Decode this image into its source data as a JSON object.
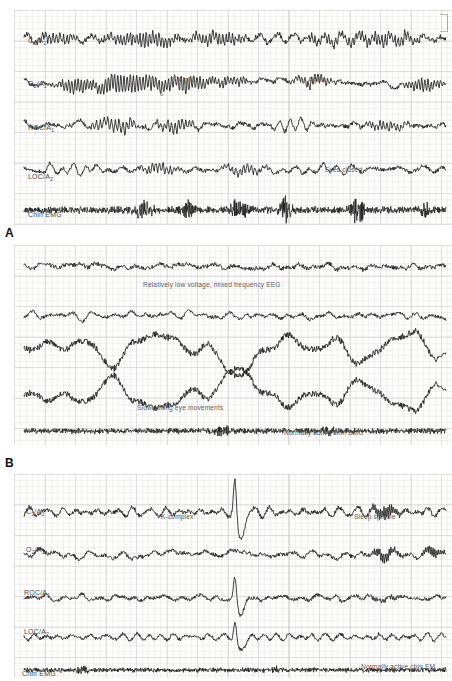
{
  "figure": {
    "background": "#ffffff",
    "trace_color": "#1b1b1b",
    "grid_color": "#96879 6",
    "label_color": "#4a4a4a"
  },
  "panels": [
    {
      "id": "A",
      "letter": "A",
      "stage": "Stage wake / drowsy",
      "channels": [
        {
          "label": "C",
          "sub1": "3",
          "label2": "/A",
          "sub2": "2",
          "full": "C3/A2",
          "type": "eeg"
        },
        {
          "label": "O",
          "sub1": "2",
          "label2": "/A",
          "sub2": "1",
          "full": "O2/A1",
          "type": "eeg"
        },
        {
          "label": "ROC/A",
          "sub1": "",
          "label2": "",
          "sub2": "1",
          "full": "ROC/A1",
          "type": "eog"
        },
        {
          "label": "LOC/A",
          "sub1": "",
          "label2": "",
          "sub2": "2",
          "full": "LOC/A2",
          "type": "eog"
        },
        {
          "label": "Chin EMG",
          "sub1": "",
          "label2": "",
          "sub2": "",
          "full": "Chin EMG",
          "type": "emg"
        }
      ],
      "annotations": [
        {
          "text": "Alpha",
          "x": 155,
          "y": 81
        },
        {
          "text": "o",
          "x": 160,
          "y": 95
        },
        {
          "text": "Alpha",
          "x": 310,
          "y": 81
        },
        {
          "text": "Eyes closed",
          "x": 330,
          "y": 170
        }
      ]
    },
    {
      "id": "B",
      "letter": "B",
      "stage": "Stage 1 sleep",
      "channels": [
        {
          "full": "C3/A2",
          "type": "eeg"
        },
        {
          "full": "O2/A1",
          "type": "eeg"
        },
        {
          "full": "ROC/A1",
          "type": "eog"
        },
        {
          "full": "LOC/A2",
          "type": "eog"
        },
        {
          "full": "Chin EMG",
          "type": "emg"
        }
      ],
      "annotations": [
        {
          "text": "Relatively low voltage, mixed frequency EEG",
          "x": 143,
          "y": 284
        },
        {
          "text": "Slow-rolling eye movements",
          "x": 140,
          "y": 407
        },
        {
          "text": "Normally active chin EMG",
          "x": 285,
          "y": 432
        }
      ]
    },
    {
      "id": "C",
      "letter": "",
      "stage": "Stage 2 sleep",
      "channels": [
        {
          "label": "C",
          "sub1": "3",
          "label2": "/A",
          "sub2": "2",
          "full": "C3/A2",
          "type": "eeg"
        },
        {
          "label": "O",
          "sub1": "2",
          "label2": "/A",
          "sub2": "1",
          "full": "O2/A1",
          "type": "eeg"
        },
        {
          "label": "ROC/A",
          "sub1": "",
          "label2": "",
          "sub2": "1",
          "full": "ROC/A1",
          "type": "eog"
        },
        {
          "label": "LOC/A",
          "sub1": "",
          "label2": "",
          "sub2": "2",
          "full": "LOC/A2",
          "type": "eog"
        },
        {
          "label": "Chin EMG",
          "sub1": "",
          "label2": "",
          "sub2": "",
          "full": "Chin EMG",
          "type": "emg"
        }
      ],
      "annotations": [
        {
          "text": "K-complex",
          "x": 162,
          "y": 516
        },
        {
          "text": "Sleep spindle",
          "x": 355,
          "y": 516
        },
        {
          "text": "Normally active chin EM",
          "x": 360,
          "y": 666
        }
      ]
    }
  ],
  "labels": {
    "a_c3a2": "C",
    "a_c3a2_sub1": "3",
    "a_c3a2_mid": "/A",
    "a_c3a2_sub2": "2",
    "a_o2a1": "O",
    "a_o2a1_sub1": "2",
    "a_o2a1_mid": "/A",
    "a_o2a1_sub2": "1",
    "a_roc": "ROC/A",
    "a_roc_sub": "1",
    "a_loc": "LOC/A",
    "a_loc_sub": "2",
    "a_emg": "Chin EMG",
    "c_c3a2": "C",
    "c_c3a2_sub1": "3",
    "c_c3a2_mid": "/A",
    "c_c3a2_sub2": "2",
    "c_o2a1": "O",
    "c_o2a1_sub1": "2",
    "c_o2a1_mid": "/A",
    "c_o2a1_sub2": "1",
    "c_roc": "ROC/A",
    "c_roc_sub": "1",
    "c_loc": "LOC/A",
    "c_loc_sub": "2",
    "c_emg": "Chin EMG",
    "letter_a": "A",
    "letter_b": "B",
    "annot_alpha_1": "Alpha",
    "annot_alpha_o": "o",
    "annot_alpha_2": "Alpha",
    "annot_eyes_closed": "Eyes closed",
    "annot_lowvolt": "Relatively low voltage, mixed frequency EEG",
    "annot_slowroll": "Slow-rolling eye movements",
    "annot_chin_b": "Normally active chin EMG",
    "annot_kcomplex": "K-complex",
    "annot_spindle": "Sleep spindle",
    "annot_chin_c": "Normally active chin EM"
  },
  "chart_data": {
    "type": "line",
    "xlabel": "Time (30-second epoch)",
    "ylabel": "Amplitude (microvolts)",
    "grid": true,
    "legend_position": "inline-left",
    "panels": [
      {
        "panel": "A",
        "stage": "Wake with eyes closed (alpha rhythm)",
        "series": [
          {
            "name": "C3/A2",
            "type": "eeg",
            "dominant_frequency_hz": 9.5,
            "amplitude_uv": 35,
            "pattern": "alpha bursts on low-voltage background"
          },
          {
            "name": "O2/A1",
            "type": "eeg",
            "dominant_frequency_hz": 10.0,
            "amplitude_uv": 40,
            "pattern": "prominent posterior alpha bursts"
          },
          {
            "name": "ROC/A1",
            "type": "eog",
            "dominant_frequency_hz": 1.5,
            "amplitude_uv": 45,
            "pattern": "blink and slow drift artefact"
          },
          {
            "name": "LOC/A2",
            "type": "eog",
            "dominant_frequency_hz": 1.5,
            "amplitude_uv": 45,
            "pattern": "blink and slow drift artefact"
          },
          {
            "name": "Chin EMG",
            "type": "emg",
            "dominant_frequency_hz": 40.0,
            "amplitude_uv": 30,
            "pattern": "high tonic activity with movement spikes"
          }
        ]
      },
      {
        "panel": "B",
        "stage": "Stage 1 NREM sleep",
        "series": [
          {
            "name": "C3/A2",
            "type": "eeg",
            "dominant_frequency_hz": 5.0,
            "amplitude_uv": 28,
            "pattern": "relatively low voltage, mixed frequency"
          },
          {
            "name": "O2/A1",
            "type": "eeg",
            "dominant_frequency_hz": 5.5,
            "amplitude_uv": 25,
            "pattern": "relatively low voltage, mixed frequency"
          },
          {
            "name": "ROC/A1",
            "type": "eog",
            "dominant_frequency_hz": 0.4,
            "amplitude_uv": 90,
            "pattern": "slow-rolling eye movements"
          },
          {
            "name": "LOC/A2",
            "type": "eog",
            "dominant_frequency_hz": 0.4,
            "amplitude_uv": 90,
            "pattern": "slow-rolling eye movements, out of phase"
          },
          {
            "name": "Chin EMG",
            "type": "emg",
            "dominant_frequency_hz": 40.0,
            "amplitude_uv": 22,
            "pattern": "normally active chin EMG"
          }
        ]
      },
      {
        "panel": "C",
        "stage": "Stage 2 NREM sleep",
        "series": [
          {
            "name": "C3/A2",
            "type": "eeg",
            "dominant_frequency_hz": 6.0,
            "amplitude_uv": 35,
            "pattern": "K-complex at ~50% epoch, sleep spindle at ~85% epoch"
          },
          {
            "name": "O2/A1",
            "type": "eeg",
            "dominant_frequency_hz": 6.0,
            "amplitude_uv": 30,
            "pattern": "background theta with spindle"
          },
          {
            "name": "ROC/A1",
            "type": "eog",
            "dominant_frequency_hz": 2.0,
            "amplitude_uv": 35,
            "pattern": "EEG breakthrough, no eye movements"
          },
          {
            "name": "LOC/A2",
            "type": "eog",
            "dominant_frequency_hz": 2.0,
            "amplitude_uv": 35,
            "pattern": "EEG breakthrough, no eye movements"
          },
          {
            "name": "Chin EMG",
            "type": "emg",
            "dominant_frequency_hz": 40.0,
            "amplitude_uv": 18,
            "pattern": "normally active chin EMG"
          }
        ],
        "events": [
          {
            "label": "K-complex",
            "x_fraction": 0.5
          },
          {
            "label": "Sleep spindle",
            "x_fraction": 0.86
          }
        ]
      }
    ]
  }
}
